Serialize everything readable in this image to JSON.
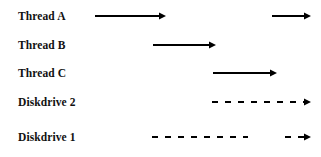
{
  "diagram": {
    "type": "timeline-arrow-diagram",
    "background_color": "#ffffff",
    "line_color": "#000000",
    "text_color": "#111111",
    "width": 321,
    "height": 157,
    "rows": [
      {
        "label": "Thread A",
        "label_x": 18,
        "row_top": 2,
        "line_y": 14,
        "style": "solid",
        "segments": [
          {
            "x1": 95,
            "x2": 166,
            "arrowhead": true
          },
          {
            "x1": 272,
            "x2": 311,
            "arrowhead": true
          }
        ]
      },
      {
        "label": "Thread B",
        "label_x": 18,
        "row_top": 31,
        "line_y": 14,
        "style": "solid",
        "segments": [
          {
            "x1": 153,
            "x2": 216,
            "arrowhead": true
          }
        ]
      },
      {
        "label": "Thread C",
        "label_x": 18,
        "row_top": 59,
        "line_y": 14,
        "style": "solid",
        "segments": [
          {
            "x1": 213,
            "x2": 277,
            "arrowhead": true
          }
        ]
      },
      {
        "label": "Diskdrive 2",
        "label_x": 18,
        "row_top": 88,
        "line_y": 14,
        "style": "dashed",
        "dash_pattern": "6 7",
        "segments": [
          {
            "x1": 212,
            "x2": 311,
            "arrowhead": true
          }
        ]
      },
      {
        "label": "Diskdrive 1",
        "label_x": 18,
        "row_top": 123,
        "line_y": 14,
        "style": "dashed",
        "dash_pattern": "6 7",
        "segments": [
          {
            "x1": 152,
            "x2": 248,
            "arrowhead": false
          },
          {
            "x1": 285,
            "x2": 311,
            "arrowhead": true
          }
        ]
      }
    ]
  }
}
